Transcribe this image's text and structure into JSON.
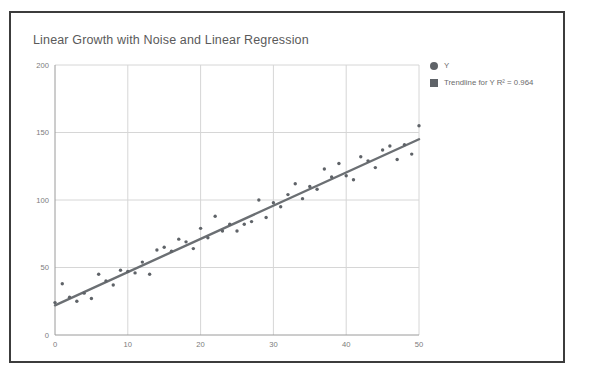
{
  "chart_data": {
    "type": "scatter",
    "title": "Linear Growth with Noise and Linear Regression",
    "xlabel": "",
    "ylabel": "",
    "xlim": [
      0,
      50
    ],
    "ylim": [
      0,
      200
    ],
    "grid": true,
    "legend_position": "right",
    "x_ticks": [
      "0",
      "10",
      "20",
      "30",
      "40",
      "50"
    ],
    "y_ticks": [
      "0",
      "50",
      "100",
      "150",
      "200"
    ],
    "series": [
      {
        "name": "Y",
        "marker": "circle",
        "color": "#5f6368",
        "x": [
          0,
          1,
          2,
          3,
          4,
          5,
          6,
          7,
          8,
          9,
          10,
          11,
          12,
          13,
          14,
          15,
          16,
          17,
          18,
          19,
          20,
          21,
          22,
          23,
          24,
          25,
          26,
          27,
          28,
          29,
          30,
          31,
          32,
          33,
          34,
          35,
          36,
          37,
          38,
          39,
          40,
          41,
          42,
          43,
          44,
          45,
          46,
          47,
          48,
          49,
          50
        ],
        "y": [
          24,
          38,
          28,
          25,
          31,
          27,
          45,
          40,
          37,
          48,
          47,
          46,
          54,
          45,
          63,
          65,
          62,
          71,
          69,
          64,
          79,
          72,
          88,
          77,
          82,
          77,
          82,
          84,
          100,
          87,
          98,
          95,
          104,
          112,
          101,
          110,
          108,
          123,
          117,
          127,
          118,
          115,
          132,
          129,
          124,
          137,
          140,
          130,
          141,
          134,
          155
        ]
      },
      {
        "name": "Trendline for Y R² = 0.964",
        "marker": "square",
        "color": "#5f6368",
        "type": "line",
        "r_squared": 0.964,
        "slope": 2.46,
        "intercept": 22,
        "endpoints": [
          [
            0,
            22
          ],
          [
            50,
            145
          ]
        ]
      }
    ],
    "legend": [
      {
        "label": "Y",
        "marker": "circle",
        "color": "#5f6368"
      },
      {
        "label": "Trendline for Y R² = 0.964",
        "marker": "square",
        "color": "#5f6368"
      }
    ]
  },
  "colors": {
    "frame_border": "#3c3c3c",
    "title_text": "#5a5a5a",
    "tick_text": "#7b7b7b",
    "gridline": "#d6d6d6",
    "axis": "#9a9a9a",
    "marker": "#5f6368",
    "trendline": "#6b6f73"
  }
}
